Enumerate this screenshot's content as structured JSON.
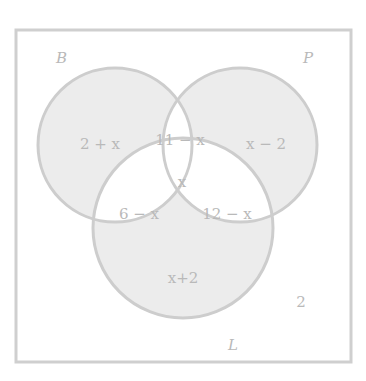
{
  "diagram": {
    "type": "venn-3",
    "colors": {
      "background": "#ffffff",
      "border": "#cfcfcf",
      "circle_stroke": "#cdcdcd",
      "shaded_fill": "#ececec",
      "text": "#b9b9b9"
    },
    "sets": [
      {
        "id": "B",
        "label": "B"
      },
      {
        "id": "P",
        "label": "P"
      },
      {
        "id": "L",
        "label": "L"
      }
    ],
    "regions": {
      "B_only": "2 + x",
      "P_only": "x − 2",
      "L_only": "x+2",
      "B_and_P_only": "11 − x",
      "B_and_L_only": "6 − x",
      "P_and_L_only": "12 − x",
      "B_P_L": "x",
      "outside": "2"
    }
  }
}
